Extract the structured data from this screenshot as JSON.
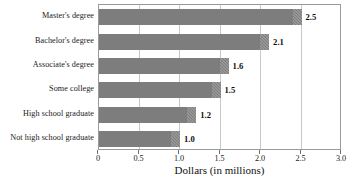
{
  "chart_data": {
    "type": "bar",
    "orientation": "horizontal",
    "title": "",
    "xlabel": "Dollars (in millions)",
    "ylabel": "",
    "xlim": [
      0,
      3.0
    ],
    "xticks": [
      "0",
      "0.5",
      "1.0",
      "1.5",
      "2.0",
      "2.5",
      "3.0"
    ],
    "xtick_values": [
      0,
      0.5,
      1.0,
      1.5,
      2.0,
      2.5,
      3.0
    ],
    "grid": "vertical",
    "legend": "none",
    "bar_color": "#7d7d7d",
    "categories": [
      "Master's degree",
      "Bachelor's degree",
      "Associate's degree",
      "Some college",
      "High school graduate",
      "Not high school graduate"
    ],
    "values": [
      2.5,
      2.1,
      1.6,
      1.5,
      1.2,
      1.0
    ],
    "data_labels": [
      "2.5",
      "2.1",
      "1.6",
      "1.5",
      "1.2",
      "1.0"
    ]
  },
  "axis": {
    "x_title": "Dollars (in millions)"
  },
  "source_note": {
    "text": ""
  }
}
